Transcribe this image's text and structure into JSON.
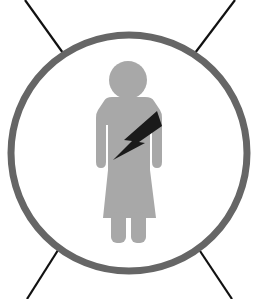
{
  "figure": {
    "icons": [
      "woman-figure-icon",
      "lightning-bolt-icon",
      "circle-frame-icon"
    ]
  },
  "colors": {
    "background": "#ffffff",
    "circle_stroke": "#666666",
    "figure_fill": "#a8a8a8",
    "bolt_fill": "#1a1a1a",
    "connector_lines": "#111111"
  },
  "geometry": {
    "circle": {
      "cx": 129,
      "cy": 153,
      "r": 118,
      "stroke_width": 7
    }
  }
}
